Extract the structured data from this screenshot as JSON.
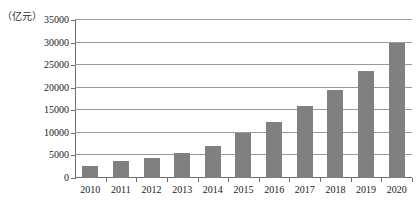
{
  "chart_data": {
    "type": "bar",
    "title": "",
    "subtitle": "",
    "unit_label": "（亿元）",
    "xlabel": "",
    "ylabel": "",
    "categories": [
      "2010",
      "2011",
      "2012",
      "2013",
      "2014",
      "2015",
      "2016",
      "2017",
      "2018",
      "2019",
      "2020"
    ],
    "values": [
      2700,
      3800,
      4500,
      5500,
      7200,
      10000,
      12300,
      16000,
      19500,
      23800,
      29800
    ],
    "ylim": [
      0,
      35000
    ],
    "ytick_interval": 5000,
    "ytick_labels": [
      "35000",
      "30000",
      "25000",
      "20000",
      "15000",
      "10000",
      "5000",
      "0"
    ],
    "ytick_values": [
      35000,
      30000,
      25000,
      20000,
      15000,
      10000,
      5000,
      0
    ],
    "grid": "horizontal",
    "legend": "none",
    "annotations": [],
    "colors": {
      "bar": "#808080",
      "gridline": "#9a9a9a",
      "axis": "#6f6f6f",
      "text": "#1a1a1a",
      "background": "#ffffff"
    }
  }
}
